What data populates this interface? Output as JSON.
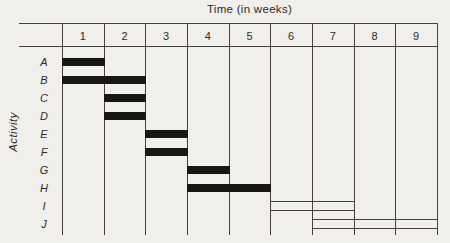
{
  "chart_data": {
    "type": "bar",
    "variant": "gantt",
    "title": "Time (in weeks)",
    "ylabel": "Activity",
    "xlabel": "",
    "x_categories": [
      "1",
      "2",
      "3",
      "4",
      "5",
      "6",
      "7",
      "8",
      "9"
    ],
    "y_categories": [
      "A",
      "B",
      "C",
      "D",
      "E",
      "F",
      "G",
      "H",
      "I",
      "J"
    ],
    "x_axis_unit": "weeks",
    "x_range_weeks": [
      0,
      9
    ],
    "grid": "vertical-only",
    "legend": "none",
    "bars": [
      {
        "activity": "A",
        "start_week": 0,
        "end_week": 1,
        "style": "filled"
      },
      {
        "activity": "B",
        "start_week": 0,
        "end_week": 2,
        "style": "filled"
      },
      {
        "activity": "C",
        "start_week": 1,
        "end_week": 2,
        "style": "filled"
      },
      {
        "activity": "D",
        "start_week": 1,
        "end_week": 2,
        "style": "filled"
      },
      {
        "activity": "E",
        "start_week": 2,
        "end_week": 3,
        "style": "filled"
      },
      {
        "activity": "F",
        "start_week": 2,
        "end_week": 3,
        "style": "filled"
      },
      {
        "activity": "G",
        "start_week": 3,
        "end_week": 4,
        "style": "filled"
      },
      {
        "activity": "H",
        "start_week": 3,
        "end_week": 5,
        "style": "filled"
      },
      {
        "activity": "I",
        "start_week": 5,
        "end_week": 7,
        "style": "outline"
      },
      {
        "activity": "J",
        "start_week": 6,
        "end_week": 9,
        "style": "outline"
      }
    ],
    "colors": {
      "background": "#f1efeb",
      "bar_fill": "#191715",
      "grid_line": "#44403c",
      "text": "#2e2b28"
    }
  }
}
